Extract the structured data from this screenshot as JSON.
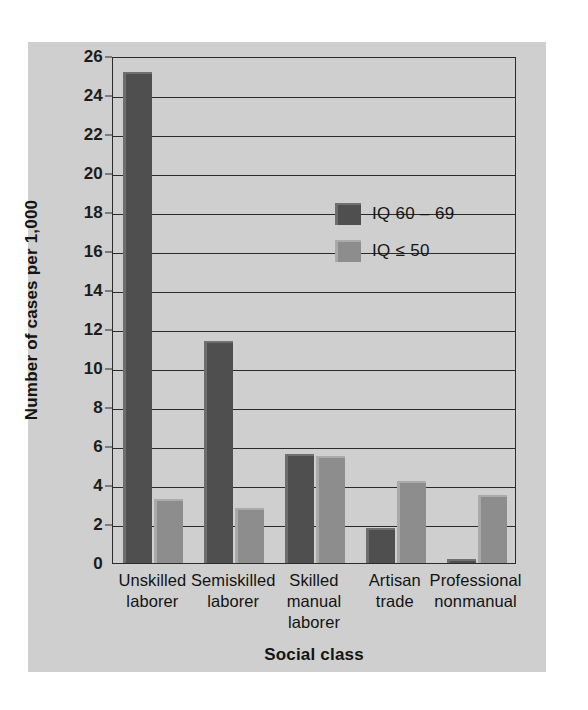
{
  "chart_data": {
    "type": "bar",
    "title": "",
    "xlabel": "Social class",
    "ylabel": "Number of cases per 1,000",
    "categories": [
      "Unskilled\nlaborer",
      "Semiskilled\nlaborer",
      "Skilled\nmanual\nlaborer",
      "Artisan\ntrade",
      "Professional\nnonmanual"
    ],
    "category_lines": [
      [
        "Unskilled",
        "laborer"
      ],
      [
        "Semiskilled",
        "laborer"
      ],
      [
        "Skilled",
        "manual",
        "laborer"
      ],
      [
        "Artisan",
        "trade"
      ],
      [
        "Professional",
        "nonmanual"
      ]
    ],
    "series": [
      {
        "name": "IQ 60 – 69",
        "color": "#4f4f4f",
        "values": [
          25.2,
          11.4,
          5.6,
          1.8,
          0.2
        ]
      },
      {
        "name": "IQ ≤ 50",
        "color": "#8d8d8d",
        "values": [
          3.3,
          2.8,
          5.5,
          4.2,
          3.5
        ]
      }
    ],
    "ylim": [
      0,
      26
    ],
    "ytick_step": 2,
    "yticks": [
      0,
      2,
      4,
      6,
      8,
      10,
      12,
      14,
      16,
      18,
      20,
      22,
      24,
      26
    ],
    "ytick_labels": [
      "0",
      "2",
      "4",
      "6",
      "8",
      "10",
      "12",
      "14",
      "16",
      "18",
      "20",
      "22",
      "24",
      "26"
    ],
    "grid": true,
    "grid_axis": "y",
    "legend_position": "upper-center-right",
    "background_color": "#cfcfcf",
    "axis_color": "#2b2b2b"
  },
  "legend": {
    "entries": [
      {
        "label": "IQ 60 – 69",
        "swatch": "dark"
      },
      {
        "label": "IQ ≤ 50",
        "swatch": "light"
      }
    ]
  },
  "axes": {
    "y_title": "Number of cases per 1,000",
    "x_title": "Social class"
  }
}
